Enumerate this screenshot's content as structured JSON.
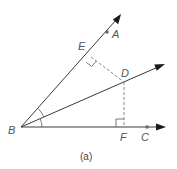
{
  "figure": {
    "caption": "(a)",
    "colors": {
      "line": "#3a3a3a",
      "dashed": "#8a8a8a",
      "label": "#555555",
      "arrowhead": "#1a1a1a",
      "background": "#ffffff"
    },
    "vertex": {
      "label": "B"
    },
    "rays": [
      {
        "name": "BA",
        "points_on_ray": [
          "E",
          "A"
        ]
      },
      {
        "name": "BD",
        "points_on_ray": [
          "D"
        ],
        "role": "angle bisector"
      },
      {
        "name": "BC",
        "points_on_ray": [
          "F",
          "C"
        ]
      }
    ],
    "perpendiculars": [
      {
        "from": "D",
        "to": "E",
        "onto_ray": "BA",
        "right_angle_at": "E",
        "style": "dashed"
      },
      {
        "from": "D",
        "to": "F",
        "onto_ray": "BC",
        "right_angle_at": "F",
        "style": "dashed"
      }
    ],
    "angle_marks": [
      {
        "at": "B",
        "between": [
          "BA",
          "BD"
        ]
      },
      {
        "at": "B",
        "between": [
          "BD",
          "BC"
        ]
      }
    ],
    "labels": {
      "A": "A",
      "B": "B",
      "C": "C",
      "D": "D",
      "E": "E",
      "F": "F"
    }
  }
}
